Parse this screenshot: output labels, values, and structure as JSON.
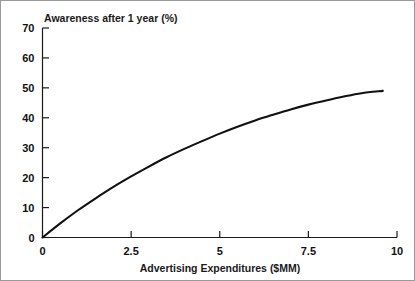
{
  "chart_data": {
    "type": "line",
    "title": "Awareness after 1 year (%)",
    "xlabel": "Advertising Expenditures ($MM)",
    "ylabel": "Awareness after 1 year (%)",
    "xlim": [
      0,
      10
    ],
    "ylim": [
      0,
      70
    ],
    "grid": false,
    "legend": "none",
    "x_ticks": [
      "0",
      "2.5",
      "5",
      "7.5",
      "10"
    ],
    "x_tick_values": [
      0,
      2.5,
      5,
      7.5,
      10
    ],
    "y_ticks": [
      "0",
      "10",
      "20",
      "30",
      "40",
      "50",
      "60",
      "70"
    ],
    "y_tick_values": [
      0,
      10,
      20,
      30,
      40,
      50,
      60,
      70
    ],
    "series": [
      {
        "name": "Awareness response curve",
        "x": [
          0,
          0.5,
          1,
          1.5,
          2,
          2.5,
          3,
          3.5,
          4,
          4.5,
          5,
          5.5,
          6,
          6.5,
          7,
          7.5,
          8,
          8.5,
          9,
          9.6
        ],
        "values": [
          0,
          4.7,
          9.1,
          13.1,
          16.9,
          20.4,
          23.7,
          26.8,
          29.6,
          32.2,
          34.7,
          37.0,
          39.1,
          41.0,
          42.8,
          44.4,
          45.8,
          47.1,
          48.2,
          49.0
        ]
      }
    ]
  },
  "axes": {
    "title": "Awareness after 1 year (%)",
    "xlabel": "Advertising Expenditures ($MM)"
  },
  "colors": {
    "curve": "#111111",
    "axis": "#1a1a1a",
    "background": "#ffffff",
    "border": "#9a9a9a"
  }
}
